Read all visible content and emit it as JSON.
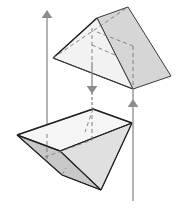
{
  "diagram": {
    "title": "",
    "colors": {
      "background": "#ffffff",
      "edge": "#3a3a3a",
      "hidden_edge": "#777777",
      "arrow": "#8c8c8c",
      "face_light": "#f1f1f1",
      "face_mid": "#dcdcdc",
      "face_dark": "#c4c4c4"
    },
    "pieces": [
      {
        "name": "upper-wedge",
        "label": ""
      },
      {
        "name": "lower-wedge",
        "label": ""
      }
    ],
    "arrows": [
      {
        "name": "left-arrow",
        "direction": "up"
      },
      {
        "name": "middle-arrow",
        "direction": "down"
      },
      {
        "name": "right-arrow",
        "direction": "up"
      }
    ]
  }
}
